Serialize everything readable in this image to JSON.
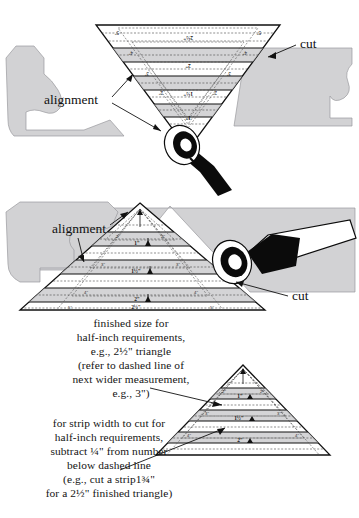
{
  "document": {
    "title": "Cutting triangles with a quilting ruler",
    "type": "instructional-diagram"
  },
  "colors": {
    "fabric_gray": "#d2d2d4",
    "fabric_gray_dark": "#b9b9bc",
    "ruler_fill": "#ffffff",
    "ruler_band": "#c9c9cc",
    "line_black": "#111111",
    "cutter_black": "#0b0b0b",
    "paper_white": "#ffffff"
  },
  "figures": [
    {
      "id": "top-figure",
      "name": "inverted-triangle-ruler",
      "orientation": "point-down",
      "callouts": [
        {
          "label": "cut",
          "name": "cut-callout-top"
        },
        {
          "label": "alignment",
          "name": "alignment-callout-top"
        }
      ],
      "row_labels": [
        "1\"",
        "1½\"",
        "2\"",
        "2½\""
      ],
      "edge_labels": [
        "2\"",
        "3\"",
        "4\"",
        "5\""
      ],
      "tool": "rotary-cutter"
    },
    {
      "id": "middle-figure",
      "name": "upright-triangle-ruler",
      "orientation": "point-up",
      "callouts": [
        {
          "label": "alignment",
          "name": "alignment-callout-middle"
        },
        {
          "label": "cut",
          "name": "cut-callout-middle"
        }
      ],
      "row_labels": [
        "1\"",
        "1½\"",
        "2\"",
        "2½\""
      ],
      "edge_labels": [
        "2\"",
        "3\"",
        "4\"",
        "5\""
      ],
      "tool": "rotary-cutter"
    },
    {
      "id": "bottom-figure",
      "name": "upright-triangle-ruler-detail",
      "orientation": "point-up",
      "row_labels": [
        "1\"",
        "1½\"",
        "2\"",
        "2½\""
      ],
      "edge_labels": [
        "2\"",
        "3\"",
        "4\""
      ]
    }
  ],
  "captions": {
    "finished_size": {
      "name": "finished-size-caption",
      "lines": [
        "finished size for",
        "half-inch requirements,",
        "e.g., 2½\" triangle",
        "(refer to dashed line of",
        "next wider measurement,",
        "e.g., 3\")"
      ]
    },
    "strip_width": {
      "name": "strip-width-caption",
      "lines": [
        "for strip width to cut for",
        "half-inch requirements,",
        "subtract ¼\" from number",
        "below dashed line",
        "(e.g., cut a strip1¾\"",
        "for a 2½\" finished triangle)"
      ]
    }
  },
  "labels": {
    "cut": "cut",
    "alignment": "alignment"
  },
  "ruler_marks": {
    "row_1": "1\"",
    "row_1_5": "1½\"",
    "row_2": "2\"",
    "row_2_5": "2½\"",
    "edge_2": "2\"",
    "edge_3": "3\"",
    "edge_4": "4\"",
    "edge_5": "5\""
  }
}
